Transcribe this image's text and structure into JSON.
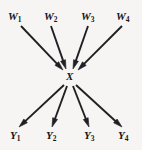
{
  "figure": {
    "background_color": "#f6f5f3",
    "stroke_color": "#201f24",
    "width": 142,
    "height": 150
  },
  "center": {
    "name": "X",
    "symbol": "X",
    "x": 70,
    "y": 77
  },
  "inputs": [
    {
      "symbol": "W",
      "subscript": "1",
      "label_x": 8,
      "label_y": 11,
      "tail_x": 21,
      "tail_y": 26,
      "head_x": 63,
      "head_y": 70
    },
    {
      "symbol": "W",
      "subscript": "2",
      "label_x": 44,
      "label_y": 11,
      "tail_x": 51,
      "tail_y": 26,
      "head_x": 66,
      "head_y": 69
    },
    {
      "symbol": "W",
      "subscript": "3",
      "label_x": 81,
      "label_y": 11,
      "tail_x": 88,
      "tail_y": 26,
      "head_x": 73,
      "head_y": 69
    },
    {
      "symbol": "W",
      "subscript": "4",
      "label_x": 116,
      "label_y": 11,
      "tail_x": 122,
      "tail_y": 26,
      "head_x": 78,
      "head_y": 70
    }
  ],
  "outputs": [
    {
      "symbol": "Y",
      "subscript": "1",
      "label_x": 10,
      "label_y": 130,
      "tail_x": 64,
      "tail_y": 85,
      "head_x": 19,
      "head_y": 127
    },
    {
      "symbol": "Y",
      "subscript": "2",
      "label_x": 46,
      "label_y": 130,
      "tail_x": 67,
      "tail_y": 86,
      "head_x": 52,
      "head_y": 127
    },
    {
      "symbol": "Y",
      "subscript": "3",
      "label_x": 84,
      "label_y": 130,
      "tail_x": 73,
      "tail_y": 86,
      "head_x": 89,
      "head_y": 127
    },
    {
      "symbol": "Y",
      "subscript": "4",
      "label_x": 118,
      "label_y": 130,
      "tail_x": 76,
      "tail_y": 85,
      "head_x": 122,
      "head_y": 127
    }
  ]
}
